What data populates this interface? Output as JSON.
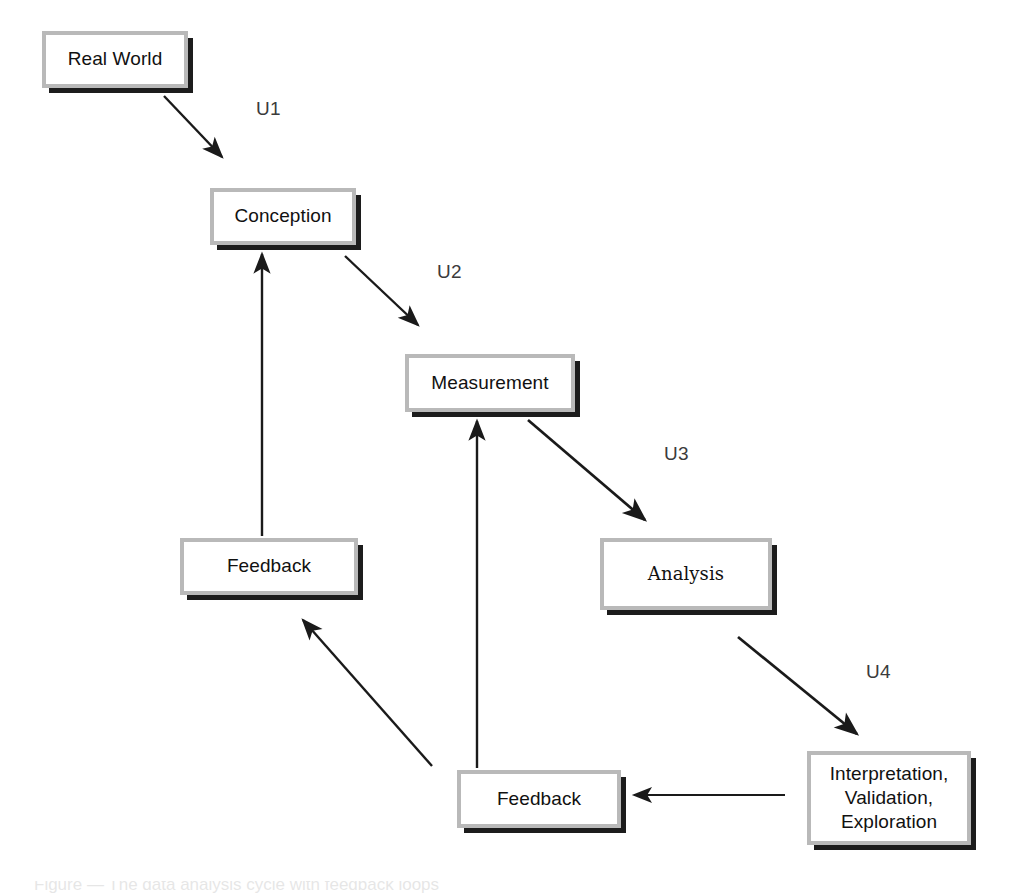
{
  "diagram": {
    "title": "Data Analysis Cycle",
    "background_color": "#ffffff",
    "node_border_color": "#b9b9b9",
    "node_shadow_color": "#1c1c1c",
    "node_fill_color": "#ffffff",
    "arrow_color": "#1a1a1a",
    "nodes": [
      {
        "id": "real-world",
        "label": "Real World",
        "x": 42,
        "y": 31,
        "w": 146,
        "h": 57
      },
      {
        "id": "conception",
        "label": "Conception",
        "x": 210,
        "y": 188,
        "w": 146,
        "h": 57
      },
      {
        "id": "measurement",
        "label": "Measurement",
        "x": 405,
        "y": 354,
        "w": 170,
        "h": 58
      },
      {
        "id": "analysis",
        "label": "Analysis",
        "x": 600,
        "y": 538,
        "w": 172,
        "h": 72
      },
      {
        "id": "interpretation",
        "label": "Interpretation,\nValidation,\nExploration",
        "x": 807,
        "y": 751,
        "w": 164,
        "h": 94
      },
      {
        "id": "feedback-bottom",
        "label": "Feedback",
        "x": 457,
        "y": 770,
        "w": 164,
        "h": 58
      },
      {
        "id": "feedback-left",
        "label": "Feedback",
        "x": 180,
        "y": 538,
        "w": 178,
        "h": 57
      }
    ],
    "edges": [
      {
        "id": "u1",
        "from": "real-world",
        "to": "conception",
        "label": "U1",
        "label_x": 256,
        "label_y": 98,
        "x1": 164,
        "y1": 96,
        "x2": 222,
        "y2": 157
      },
      {
        "id": "u2",
        "from": "conception",
        "to": "measurement",
        "label": "U2",
        "label_x": 437,
        "label_y": 261,
        "x1": 345,
        "y1": 256,
        "x2": 418,
        "y2": 325
      },
      {
        "id": "u3",
        "from": "measurement",
        "to": "analysis",
        "label": "U3",
        "label_x": 664,
        "label_y": 443,
        "x1": 528,
        "y1": 420,
        "x2": 645,
        "y2": 520
      },
      {
        "id": "u4",
        "from": "analysis",
        "to": "interpretation",
        "label": "U4",
        "label_x": 866,
        "label_y": 661,
        "x1": 738,
        "y1": 637,
        "x2": 857,
        "y2": 734
      },
      {
        "id": "interp-to-feedback",
        "from": "interpretation",
        "to": "feedback-bottom",
        "label": "",
        "x1": 785,
        "y1": 795,
        "x2": 634,
        "y2": 795
      },
      {
        "id": "feedback-to-measurement",
        "from": "feedback-bottom",
        "to": "measurement",
        "label": "",
        "x1": 477,
        "y1": 768,
        "x2": 477,
        "y2": 421
      },
      {
        "id": "feedback-to-feedback",
        "from": "feedback-bottom",
        "to": "feedback-left",
        "label": "",
        "x1": 432,
        "y1": 766,
        "x2": 303,
        "y2": 620
      },
      {
        "id": "feedbackleft-to-conception",
        "from": "feedback-left",
        "to": "conception",
        "label": "",
        "x1": 262,
        "y1": 536,
        "x2": 262,
        "y2": 254
      }
    ],
    "caption_fragment": "Figure — The data analysis cycle with feedback loops"
  }
}
